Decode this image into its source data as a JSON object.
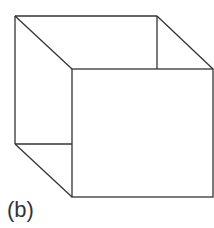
{
  "figure": {
    "label": "(b)",
    "stroke_color": "#333333",
    "vertices": {
      "back_top_left": [
        15,
        16
      ],
      "back_top_right": [
        157,
        16
      ],
      "back_bottom_left": [
        15,
        144
      ],
      "front_top_left": [
        72,
        69
      ],
      "front_top_right": [
        213,
        69
      ],
      "front_bottom_left": [
        72,
        197
      ],
      "front_bottom_right": [
        213,
        197
      ]
    }
  }
}
